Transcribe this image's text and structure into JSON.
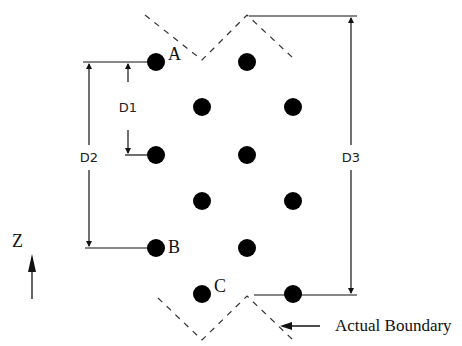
{
  "diagram": {
    "points": [
      {
        "id": "A",
        "label": "A",
        "x": 156,
        "y": 62
      },
      {
        "id": "p2",
        "label": "",
        "x": 247,
        "y": 62
      },
      {
        "id": "p3",
        "label": "",
        "x": 202,
        "y": 107
      },
      {
        "id": "p4",
        "label": "",
        "x": 293,
        "y": 107
      },
      {
        "id": "p5",
        "label": "",
        "x": 156,
        "y": 155
      },
      {
        "id": "p6",
        "label": "",
        "x": 247,
        "y": 155
      },
      {
        "id": "p7",
        "label": "",
        "x": 202,
        "y": 201
      },
      {
        "id": "p8",
        "label": "",
        "x": 293,
        "y": 201
      },
      {
        "id": "B",
        "label": "B",
        "x": 156,
        "y": 248
      },
      {
        "id": "p10",
        "label": "",
        "x": 247,
        "y": 248
      },
      {
        "id": "C",
        "label": "C",
        "x": 202,
        "y": 294
      },
      {
        "id": "p12",
        "label": "",
        "x": 293,
        "y": 294
      }
    ],
    "labels": {
      "A": "A",
      "B": "B",
      "C": "C",
      "D1": "D1",
      "D2": "D2",
      "D3": "D3",
      "axis": "Z",
      "boundary": "Actual Boundary"
    },
    "dimensions": [
      {
        "name": "D1",
        "from": "A",
        "to": "p5"
      },
      {
        "name": "D2",
        "from": "A",
        "to": "B"
      },
      {
        "name": "D3",
        "from": "top-boundary-peak",
        "to": "p12"
      }
    ]
  }
}
